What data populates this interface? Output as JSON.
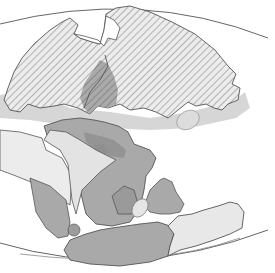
{
  "map": {
    "type": "paleogeographic-reconstruction",
    "style": "grayscale",
    "width": 275,
    "height": 273,
    "colors": {
      "background": "#ffffff",
      "hatch_fill": "#e6e6e6",
      "hatch_line": "#8a8a8a",
      "dark_gray": "#8c8c8c",
      "mid_gray": "#a8a8a8",
      "light_gray": "#d6d6d6",
      "pale_gray": "#ececec",
      "outline": "#555555",
      "projection_arc": "#666666"
    },
    "regions": [
      {
        "id": "northern-landmass-west",
        "fill": "hatched"
      },
      {
        "id": "northern-landmass-east",
        "fill": "hatched"
      },
      {
        "id": "central-shaded-block",
        "fill": "dark_gray"
      },
      {
        "id": "southern-continent-core",
        "fill": "mid_gray"
      },
      {
        "id": "southern-continent-west-plain",
        "fill": "pale_gray"
      },
      {
        "id": "southern-continent-south-wedge",
        "fill": "mid_gray"
      },
      {
        "id": "small-island-east",
        "fill": "mid_gray"
      },
      {
        "id": "southern-elongate-landmass-west",
        "fill": "mid_gray"
      },
      {
        "id": "southern-elongate-landmass-east",
        "fill": "pale_gray"
      },
      {
        "id": "pale-ellipse-northeast",
        "fill": "light_gray"
      },
      {
        "id": "pale-ellipse-south",
        "fill": "light_gray"
      }
    ],
    "labels": []
  }
}
